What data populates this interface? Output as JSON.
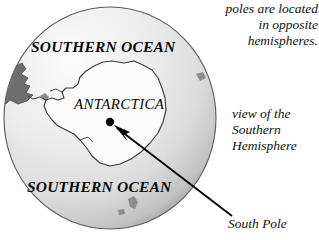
{
  "figure": {
    "type": "globe-diagram",
    "background_color": "#ffffff",
    "globe": {
      "name": "earth-globe-southern-view",
      "center_x": 110,
      "center_y": 118,
      "radius_x": 106,
      "radius_y": 111,
      "fill_light": "#f2f2f2",
      "fill_mid": "#d8d8d8",
      "fill_dark": "#9a9a9a",
      "outline_color": "#4a4a4a",
      "landmass_color": "#6e6e6e"
    },
    "continent": {
      "name": "antarctica-outline",
      "fill": "#fbfbfb",
      "stroke": "#3d3d3d"
    }
  },
  "labels": {
    "southern_ocean_top": "SOUTHERN OCEAN",
    "southern_ocean_bottom": "SOUTHERN OCEAN",
    "antarctica": "ANTARCTICA",
    "south_pole": "South Pole"
  },
  "annotations": {
    "top_right": {
      "lines": [
        "poles are located",
        "in opposite",
        "hemispheres."
      ]
    },
    "right": {
      "lines": [
        "view of the",
        "Southern",
        "Hemisphere"
      ]
    }
  },
  "pointer": {
    "name": "south-pole-leader-line",
    "color": "#000000",
    "dot_x": 110,
    "dot_y": 122,
    "dot_radius": 4,
    "line_start_x": 232,
    "line_start_y": 216,
    "line_end_x": 116,
    "line_end_y": 127
  }
}
